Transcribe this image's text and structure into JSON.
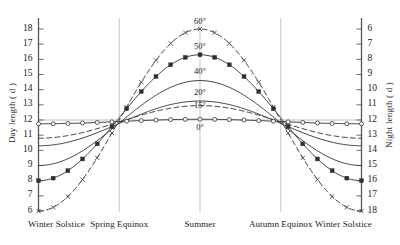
{
  "chart_data": {
    "type": "line",
    "title": "",
    "xlabel": "",
    "ylabel": "Day length ( d )",
    "y2label": "Night length ( d )",
    "grid": true,
    "legend_position": "inline-curve-labels",
    "x": [
      0,
      1,
      2,
      3,
      4
    ],
    "categories": [
      "Winter Solstice",
      "Spring Equinox",
      "Summer",
      "Autumn Equinox",
      "Winter Solstice"
    ],
    "ylim": [
      6,
      18
    ],
    "y2lim": [
      18,
      6
    ],
    "yticks": [
      18,
      17,
      16,
      15,
      14,
      13,
      12,
      11,
      10,
      9,
      8,
      7,
      6
    ],
    "y2ticks": [
      6,
      7,
      8,
      9,
      10,
      11,
      12,
      13,
      14,
      15,
      16,
      17,
      18
    ],
    "reference_line_y": 12,
    "series": [
      {
        "name": "60°",
        "label": "60°",
        "marker": "x",
        "linestyle": "dashed",
        "values": [
          6.0,
          12.0,
          18.0,
          12.0,
          6.0
        ],
        "label_x": 2.0,
        "label_y": 18.55
      },
      {
        "name": "50°",
        "label": "50°",
        "marker": "filled-square",
        "linestyle": "solid",
        "values": [
          8.0,
          12.0,
          16.3,
          12.0,
          8.0
        ],
        "label_x": 2.0,
        "label_y": 16.9
      },
      {
        "name": "40°",
        "label": "40°",
        "marker": "none",
        "linestyle": "solid",
        "values": [
          9.0,
          12.0,
          14.6,
          12.0,
          9.0
        ],
        "label_x": 2.0,
        "label_y": 15.2
      },
      {
        "name": "20°",
        "label": "20°",
        "marker": "none",
        "linestyle": "solid",
        "values": [
          10.3,
          12.0,
          13.25,
          12.0,
          10.3
        ],
        "label_x": 2.0,
        "label_y": 13.85
      },
      {
        "name": "15°",
        "label": "15°",
        "marker": "none",
        "linestyle": "dashed",
        "values": [
          10.8,
          12.0,
          12.95,
          12.0,
          10.8
        ],
        "label_x": 2.0,
        "label_y": 13.0
      },
      {
        "name": "0°",
        "label": "0°",
        "marker": "open-circle",
        "linestyle": "solid",
        "values": [
          11.75,
          12.0,
          12.05,
          12.0,
          11.75
        ],
        "label_x": 2.0,
        "label_y": 11.55
      }
    ],
    "colors": {
      "axis": "#555555",
      "grid": "#b9b9b9",
      "curve": "#3a3a3a",
      "text": "#1a1a1a",
      "background": "#ffffff"
    }
  }
}
